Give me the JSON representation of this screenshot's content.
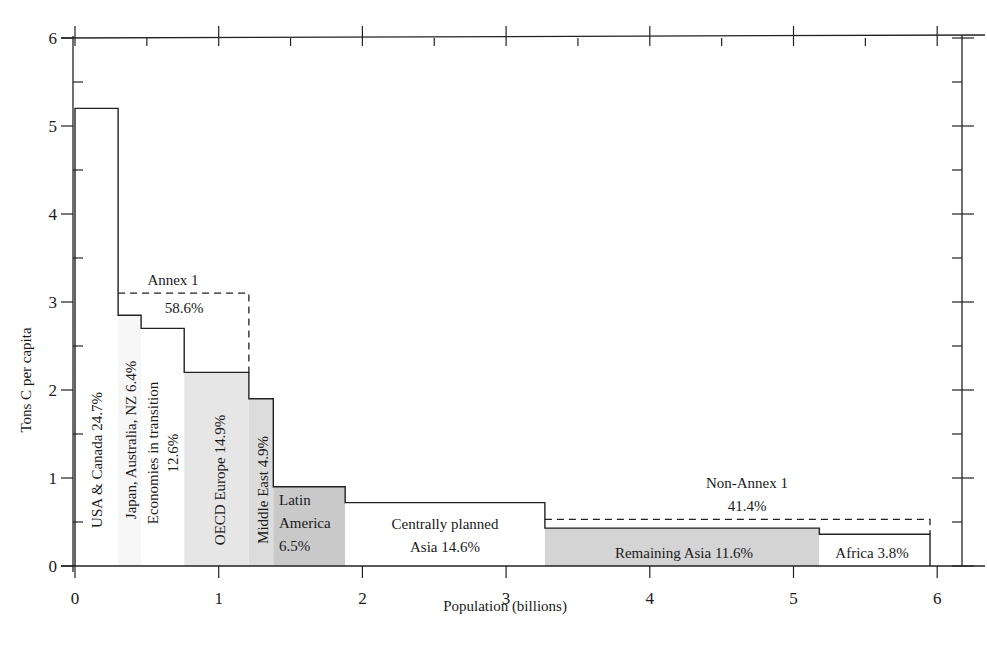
{
  "chart_data": {
    "type": "bar",
    "subtype": "variable-width step chart",
    "title": "",
    "xlabel": "Population (billions)",
    "ylabel": "Tons C per capita",
    "xlim": [
      0,
      6.2
    ],
    "ylim": [
      0,
      6
    ],
    "xticks": [
      0,
      1,
      2,
      3,
      4,
      5,
      6
    ],
    "yticks": [
      0,
      1,
      2,
      3,
      4,
      5,
      6
    ],
    "grid": false,
    "legend": null,
    "regions": [
      {
        "name": "USA & Canada",
        "share": "24.7%",
        "x0": 0.0,
        "x1": 0.3,
        "value": 5.2,
        "fill": "#ffffff",
        "label_lines": [
          "USA & Canada 24.7%"
        ],
        "orientation": "vertical"
      },
      {
        "name": "Japan, Australia, NZ",
        "share": "6.4%",
        "x0": 0.3,
        "x1": 0.46,
        "value": 2.85,
        "fill": "#f7f7f7",
        "label_lines": [
          "Japan, Australia, NZ 6.4%"
        ],
        "orientation": "vertical"
      },
      {
        "name": "Economies in transition",
        "share": "12.6%",
        "x0": 0.46,
        "x1": 0.76,
        "value": 2.7,
        "fill": "#ffffff",
        "label_lines": [
          "Economies in transition",
          "12.6%"
        ],
        "orientation": "vertical"
      },
      {
        "name": "OECD Europe",
        "share": "14.9%",
        "x0": 0.76,
        "x1": 1.21,
        "value": 2.2,
        "fill": "#e6e6e6",
        "label_lines": [
          "OECD Europe 14.9%"
        ],
        "orientation": "vertical"
      },
      {
        "name": "Middle East",
        "share": "4.9%",
        "x0": 1.21,
        "x1": 1.38,
        "value": 1.9,
        "fill": "#dcdcdc",
        "label_lines": [
          "Middle East 4.9%"
        ],
        "orientation": "vertical"
      },
      {
        "name": "Latin America",
        "share": "6.5%",
        "x0": 1.38,
        "x1": 1.88,
        "value": 0.9,
        "fill": "#c9c9c9",
        "label_lines": [
          "Latin",
          "America",
          "6.5%"
        ],
        "orientation": "horizontal"
      },
      {
        "name": "Centrally planned Asia",
        "share": "14.6%",
        "x0": 1.88,
        "x1": 3.27,
        "value": 0.72,
        "fill": "#ffffff",
        "label_lines": [
          "Centrally planned",
          "Asia 14.6%"
        ],
        "orientation": "horizontal"
      },
      {
        "name": "Remaining Asia",
        "share": "11.6%",
        "x0": 3.27,
        "x1": 5.18,
        "value": 0.43,
        "fill": "#d4d4d4",
        "label_lines": [
          "Remaining Asia 11.6%"
        ],
        "orientation": "horizontal"
      },
      {
        "name": "Africa",
        "share": "3.8%",
        "x0": 5.18,
        "x1": 5.95,
        "value": 0.36,
        "fill": "#ffffff",
        "label_lines": [
          "Africa 3.8%"
        ],
        "orientation": "horizontal"
      }
    ],
    "groups": [
      {
        "name": "Annex 1",
        "share": "58.6%",
        "x0": 0.3,
        "x1": 1.21,
        "value": 3.1,
        "style": "dashed"
      },
      {
        "name": "Non-Annex 1",
        "share": "41.4%",
        "x0": 3.27,
        "x1": 5.95,
        "value": 0.53,
        "style": "dashed"
      }
    ]
  },
  "labels": {
    "xlabel": "Population (billions)",
    "ylabel": "Tons C per capita",
    "annex1_name": "Annex 1",
    "annex1_share": "58.6%",
    "nonannex1_name": "Non-Annex 1",
    "nonannex1_share": "41.4%"
  }
}
